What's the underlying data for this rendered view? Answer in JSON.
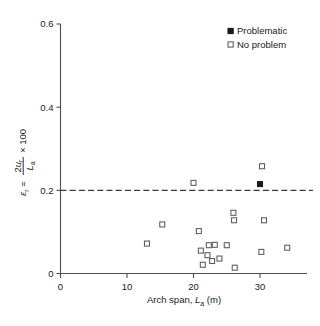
{
  "chart_data": {
    "type": "scatter",
    "title": "",
    "xlabel": "Arch span, La (m)",
    "ylabel": "er = 2ur/La x 100",
    "xlim": [
      0,
      37
    ],
    "ylim": [
      0,
      0.6
    ],
    "grid": false,
    "xticks": [
      "0",
      "10",
      "20",
      "30"
    ],
    "xtick_values": [
      0,
      10,
      20,
      30
    ],
    "yticks": [
      "0",
      "0.2",
      "0.4",
      "0.6"
    ],
    "ytick_values": [
      0,
      0.2,
      0.4,
      0.6
    ],
    "legend_position": "top-right",
    "annotations": [
      {
        "type": "hline",
        "value": 0.2,
        "style": "dashed",
        "label": "0.2 threshold"
      }
    ],
    "series": [
      {
        "name": "Problematic",
        "marker": "filled-square",
        "color": "#1a1a1a",
        "points": [
          {
            "x": 30.0,
            "y": 0.215
          }
        ]
      },
      {
        "name": "No problem",
        "marker": "open-square",
        "color": "#ffffff",
        "points": [
          {
            "x": 13.0,
            "y": 0.072
          },
          {
            "x": 15.3,
            "y": 0.118
          },
          {
            "x": 20.0,
            "y": 0.218
          },
          {
            "x": 20.8,
            "y": 0.102
          },
          {
            "x": 21.1,
            "y": 0.055
          },
          {
            "x": 21.4,
            "y": 0.021
          },
          {
            "x": 22.1,
            "y": 0.044
          },
          {
            "x": 22.3,
            "y": 0.068
          },
          {
            "x": 22.8,
            "y": 0.03
          },
          {
            "x": 23.2,
            "y": 0.069
          },
          {
            "x": 23.9,
            "y": 0.036
          },
          {
            "x": 25.0,
            "y": 0.068
          },
          {
            "x": 26.0,
            "y": 0.146
          },
          {
            "x": 26.1,
            "y": 0.128
          },
          {
            "x": 26.2,
            "y": 0.014
          },
          {
            "x": 30.3,
            "y": 0.258
          },
          {
            "x": 30.2,
            "y": 0.052
          },
          {
            "x": 30.6,
            "y": 0.128
          },
          {
            "x": 34.1,
            "y": 0.062
          }
        ]
      }
    ]
  },
  "legend": {
    "items": [
      {
        "label": "Problematic",
        "marker": "filled-square"
      },
      {
        "label": "No problem",
        "marker": "open-square"
      }
    ]
  },
  "axis_labels": {
    "x_prefix": "Arch span, ",
    "x_symbol": "L",
    "x_subscript": "a",
    "x_suffix": " (m)",
    "y_symbol": "ε",
    "y_symbol_sub": "r",
    "y_equals": "=",
    "y_num_coef": "2",
    "y_num_symbol": "u",
    "y_num_sub": "r",
    "y_den_symbol": "L",
    "y_den_sub": "a",
    "y_mult": "× 100"
  },
  "caption": {
    "text": ""
  }
}
